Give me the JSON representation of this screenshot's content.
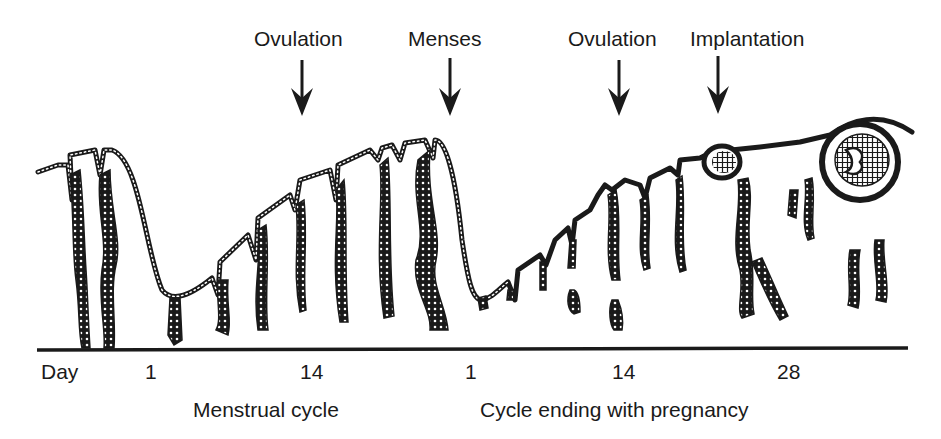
{
  "diagram": {
    "events": [
      {
        "label": "Ovulation",
        "x": 302
      },
      {
        "label": "Menses",
        "x": 450
      },
      {
        "label": "Ovulation",
        "x": 620
      },
      {
        "label": "Implantation",
        "x": 718
      }
    ],
    "axis": {
      "axis_label": "Day",
      "ticks": [
        {
          "label": "1",
          "x": 150
        },
        {
          "label": "14",
          "x": 310
        },
        {
          "label": "1",
          "x": 472
        },
        {
          "label": "14",
          "x": 624
        },
        {
          "label": "28",
          "x": 788
        }
      ]
    },
    "captions": [
      {
        "label": "Menstrual cycle",
        "x": 193
      },
      {
        "label": "Cycle ending with pregnancy",
        "x": 480
      }
    ],
    "colors": {
      "ink": "#1a1a1a",
      "background": "#ffffff"
    }
  }
}
